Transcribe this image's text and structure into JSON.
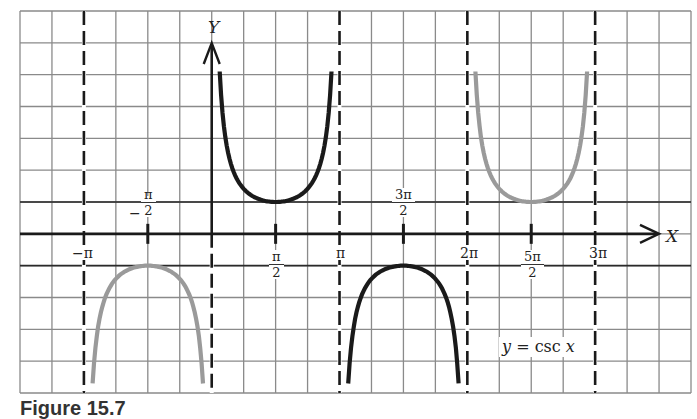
{
  "chart_data": {
    "type": "line",
    "title": "y = csc x",
    "xlabel": "X",
    "ylabel": "Y",
    "xlim_units": [
      -4.5,
      16.5
    ],
    "x_unit": "pi/4 per grid cell",
    "ylim": [
      -4.9,
      7.0
    ],
    "grid": true,
    "x_ticks": [
      {
        "value": "-π",
        "label": "−π"
      },
      {
        "value": "-π/2",
        "label_num": "π",
        "label_den": "2",
        "sign": "−"
      },
      {
        "value": "π/2",
        "label_num": "π",
        "label_den": "2"
      },
      {
        "value": "π",
        "label": "π"
      },
      {
        "value": "3π/2",
        "label_num": "3π",
        "label_den": "2"
      },
      {
        "value": "2π",
        "label": "2π"
      },
      {
        "value": "5π/2",
        "label_num": "5π",
        "label_den": "2"
      },
      {
        "value": "3π",
        "label": "3π"
      }
    ],
    "asymptotes": [
      "-π",
      "0",
      "π",
      "2π",
      "3π"
    ],
    "series": [
      {
        "name": "branch (-π, 0)",
        "domain": [
          "-π",
          "0"
        ],
        "color": "#999999",
        "extremum": {
          "x": "-π/2",
          "y": -1
        },
        "y_end": -4.7
      },
      {
        "name": "branch (0, π)",
        "domain": [
          "0",
          "π"
        ],
        "color": "#1a1a1a",
        "extremum": {
          "x": "π/2",
          "y": 1
        },
        "y_end": 5.1
      },
      {
        "name": "branch (π, 2π)",
        "domain": [
          "π",
          "2π"
        ],
        "color": "#1a1a1a",
        "extremum": {
          "x": "3π/2",
          "y": -1
        },
        "y_end": -4.7
      },
      {
        "name": "branch (2π, 3π)",
        "domain": [
          "2π",
          "3π"
        ],
        "color": "#999999",
        "extremum": {
          "x": "5π/2",
          "y": 1
        },
        "y_end": 5.1
      }
    ],
    "legend": "y = csc x",
    "caption_partial": "Figure 15.7"
  },
  "labels": {
    "y_axis": "Y",
    "x_axis": "X",
    "legend_y": "y",
    "legend_eq": " = csc ",
    "legend_x": "x",
    "minus_pi": "−π",
    "pi": "π",
    "two_pi": "2π",
    "three_pi": "3π",
    "pi_num": "π",
    "three_pi_num": "3π",
    "five_pi_num": "5π",
    "two": "2",
    "minus": "−",
    "caption": "Figure 15.7"
  },
  "colors": {
    "grid": "#8a8a8a",
    "axis": "#1a1a1a",
    "dark_curve": "#1a1a1a",
    "light_curve": "#9a9a9a",
    "asymptote": "#1a1a1a"
  }
}
